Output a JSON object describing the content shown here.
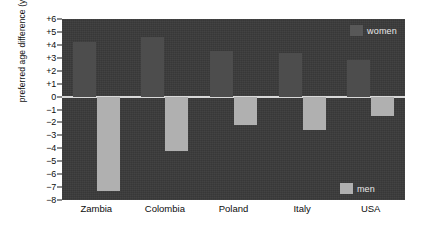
{
  "chart_data": {
    "type": "bar",
    "title": "",
    "xlabel": "",
    "ylabel": "preferred age difference (years)",
    "categories": [
      "Zambia",
      "Colombia",
      "Poland",
      "Italy",
      "USA"
    ],
    "series": [
      {
        "name": "women",
        "values": [
          4.2,
          4.6,
          3.5,
          3.4,
          2.8
        ]
      },
      {
        "name": "men",
        "values": [
          -7.3,
          -4.2,
          -2.2,
          -2.6,
          -1.5
        ]
      }
    ],
    "ylim": [
      -8,
      6
    ],
    "yticks": [
      "+6",
      "+5",
      "+4",
      "+3",
      "+2",
      "+1",
      "0",
      "−1",
      "−2",
      "−3",
      "−4",
      "−5",
      "−6",
      "−7",
      "−8"
    ],
    "ytick_values": [
      6,
      5,
      4,
      3,
      2,
      1,
      0,
      -1,
      -2,
      -3,
      -4,
      -5,
      -6,
      -7,
      -8
    ],
    "grid": false,
    "legend_position": "inside",
    "legend": [
      {
        "label": "women",
        "color": "#4d4d4d"
      },
      {
        "label": "men",
        "color": "#b0b0b0"
      }
    ],
    "colors": {
      "plot_background": "#3a3a3a",
      "zero_line": "#d8d8d8",
      "women_bar": "#4d4d4d",
      "men_bar": "#b0b0b0",
      "text_dark": "#0d0d0d",
      "text_light": "#e8e8e8"
    }
  }
}
